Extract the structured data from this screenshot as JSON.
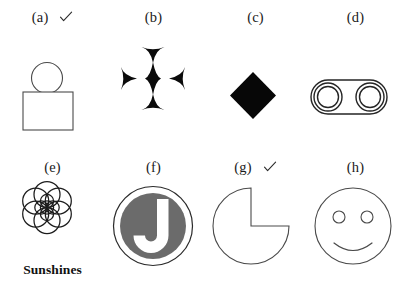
{
  "page": {
    "background_color": "#ffffff",
    "ink_color": "#3a3a3a",
    "fill_black": "#080808",
    "fill_gray": "#6b6b6b",
    "columns": 4,
    "rows": 2
  },
  "items": [
    {
      "id": "a",
      "caption": "(a)",
      "checked": true,
      "check_mark": "check-mark",
      "figure_name": "circle-on-rectangle",
      "description": "Outlined circle resting on top of an outlined rectangle"
    },
    {
      "id": "b",
      "caption": "(b)",
      "checked": false,
      "check_mark": "",
      "figure_name": "four-pointed-star-cluster",
      "description": "Central solid four-pointed star surrounded by four inward-pointing half stars"
    },
    {
      "id": "c",
      "caption": "(c)",
      "checked": false,
      "check_mark": "",
      "figure_name": "solid-diamond",
      "description": "Solid black diamond (square rotated 45 degrees)"
    },
    {
      "id": "d",
      "caption": "(d)",
      "checked": false,
      "check_mark": "",
      "figure_name": "stadium-with-two-rings",
      "description": "Outlined stadium shape containing two concentric ring pairs"
    },
    {
      "id": "e",
      "caption": "(e)",
      "checked": false,
      "check_mark": "",
      "figure_name": "sunshines-flower-logo",
      "description": "Seven overlapping circles in a flower rosette above a wordmark",
      "wordmark": "Sunshines"
    },
    {
      "id": "f",
      "caption": "(f)",
      "checked": false,
      "check_mark": "",
      "figure_name": "j-monogram-badge",
      "description": "Gray filled disc with a white letter J, enclosed by a thin outline ring",
      "letter": "J"
    },
    {
      "id": "g",
      "caption": "(g)",
      "checked": true,
      "check_mark": "check-mark",
      "figure_name": "pac-man-circle",
      "description": "Outlined circle with a quarter wedge removed from the upper right"
    },
    {
      "id": "h",
      "caption": "(h)",
      "checked": false,
      "check_mark": "",
      "figure_name": "smiley-face",
      "description": "Outlined circle with two small circular eyes and a smiling arc mouth"
    }
  ]
}
